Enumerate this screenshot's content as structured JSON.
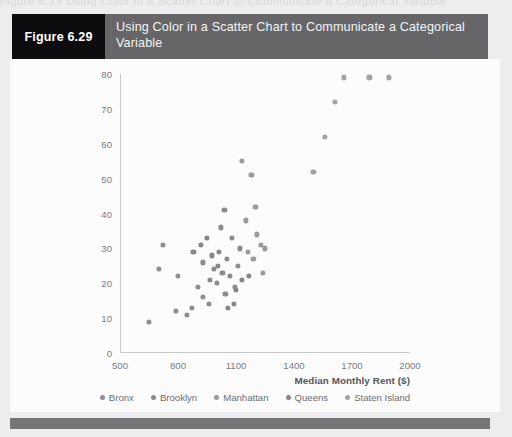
{
  "page": {
    "bleed_text": "Figure 6.29   Using Color in a Scatter Chart to Communicate a Categorical Variable",
    "background_color": "#ededed",
    "panel_color": "#fcfcfc",
    "footer_color": "#767679"
  },
  "header": {
    "tag_label": "Figure 6.29",
    "title": "Using Color in a Scatter Chart to Communicate a Categorical Variable",
    "tag_background": "#0d0d10",
    "bar_background": "#666668",
    "text_color": "#f4f4f6"
  },
  "chart_data": {
    "type": "scatter",
    "title": "",
    "xlabel": "Median Monthly Rent ($)",
    "ylabel": "",
    "xlim": [
      500,
      2000
    ],
    "ylim": [
      0,
      80
    ],
    "xticks": [
      500,
      800,
      1100,
      1400,
      1700,
      2000
    ],
    "yticks": [
      0,
      10,
      20,
      30,
      40,
      50,
      60,
      70,
      80
    ],
    "grid": false,
    "legend_position": "bottom",
    "point_color": "#8d8d92",
    "axis_color": "#c9c9cc",
    "tick_label_color": "#7b7b80",
    "series": [
      {
        "name": "Bronx",
        "color": "#8d8d92",
        "points": [
          [
            650,
            9
          ],
          [
            720,
            31
          ],
          [
            700,
            24
          ],
          [
            790,
            12
          ],
          [
            845,
            11
          ],
          [
            800,
            22
          ],
          [
            870,
            13
          ],
          [
            905,
            19
          ],
          [
            930,
            16
          ],
          [
            960,
            14
          ]
        ]
      },
      {
        "name": "Brooklyn",
        "color": "#8a8a8f",
        "points": [
          [
            930,
            26
          ],
          [
            965,
            21
          ],
          [
            985,
            24
          ],
          [
            1000,
            20
          ],
          [
            1010,
            29
          ],
          [
            1030,
            23
          ],
          [
            1045,
            17
          ],
          [
            1055,
            27
          ],
          [
            1070,
            22
          ],
          [
            1080,
            33
          ],
          [
            1020,
            36
          ],
          [
            1040,
            41
          ],
          [
            1095,
            19
          ],
          [
            1110,
            25
          ],
          [
            1120,
            30
          ]
        ]
      },
      {
        "name": "Manhattan",
        "color": "#9a9a9f",
        "points": [
          [
            1130,
            55
          ],
          [
            1180,
            51
          ],
          [
            1200,
            42
          ],
          [
            1150,
            38
          ],
          [
            1210,
            34
          ],
          [
            1230,
            31
          ],
          [
            1250,
            30
          ],
          [
            1160,
            29
          ],
          [
            1190,
            27
          ],
          [
            1240,
            23
          ]
        ]
      },
      {
        "name": "Queens",
        "color": "#86868b",
        "points": [
          [
            880,
            29
          ],
          [
            920,
            31
          ],
          [
            950,
            33
          ],
          [
            975,
            28
          ],
          [
            1005,
            25
          ],
          [
            1060,
            13
          ],
          [
            1090,
            14
          ],
          [
            1130,
            21
          ],
          [
            1165,
            22
          ],
          [
            1100,
            18
          ]
        ]
      },
      {
        "name": "Staten Island",
        "color": "#a2a2a7",
        "points": [
          [
            1560,
            62
          ],
          [
            1610,
            72
          ],
          [
            1660,
            79
          ],
          [
            1790,
            79
          ],
          [
            1890,
            79
          ],
          [
            1500,
            52
          ]
        ]
      }
    ]
  },
  "legend": {
    "items": [
      {
        "label": "Bronx",
        "color": "#8d8d92"
      },
      {
        "label": "Brooklyn",
        "color": "#8a8a8f"
      },
      {
        "label": "Manhattan",
        "color": "#9a9a9f"
      },
      {
        "label": "Queens",
        "color": "#86868b"
      },
      {
        "label": "Staten Island",
        "color": "#a2a2a7"
      }
    ]
  }
}
